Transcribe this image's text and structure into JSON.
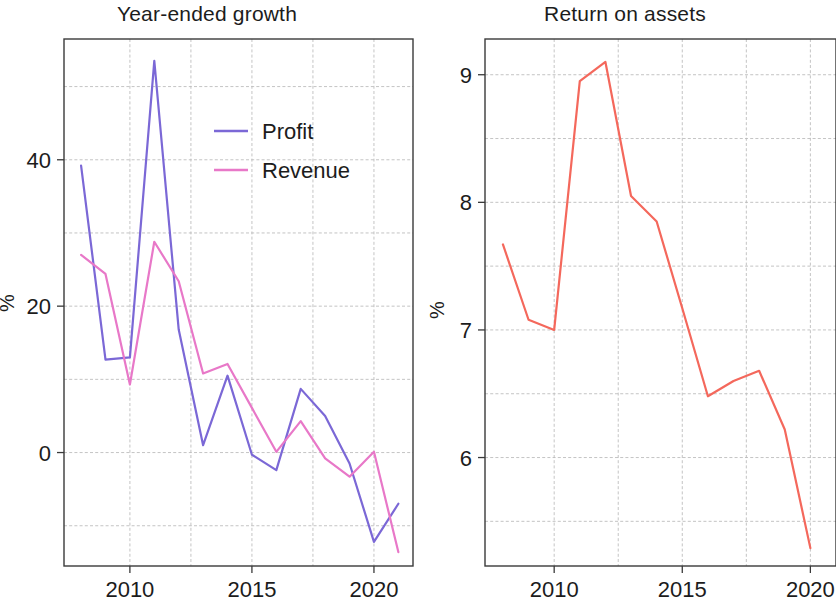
{
  "figure": {
    "width": 836,
    "height": 604,
    "background": "#ffffff"
  },
  "panels": [
    {
      "id": "year-ended-growth",
      "title": "Year-ended growth",
      "ylabel": "%",
      "x_tick_labels": [
        "2010",
        "2015",
        "2020"
      ],
      "y_tick_labels": [
        "0",
        "20",
        "40"
      ],
      "legend": [
        {
          "label": "Profit",
          "color": "#7b68d6"
        },
        {
          "label": "Revenue",
          "color": "#e878c8"
        }
      ]
    },
    {
      "id": "return-on-assets",
      "title": "Return on assets",
      "ylabel": "%",
      "x_tick_labels": [
        "2010",
        "2015",
        "2020"
      ],
      "y_tick_labels": [
        "6",
        "7",
        "8",
        "9"
      ],
      "legend": []
    }
  ],
  "chart_data": [
    {
      "type": "line",
      "title": "Year-ended growth",
      "xlabel": "",
      "ylabel": "%",
      "x": [
        2008,
        2009,
        2010,
        2011,
        2012,
        2013,
        2014,
        2015,
        2016,
        2017,
        2018,
        2019,
        2020,
        2021
      ],
      "xlim": [
        2007.3,
        2021.6
      ],
      "ylim": [
        -15.5,
        56.5
      ],
      "xticks": [
        2010,
        2015,
        2020
      ],
      "yticks": [
        0,
        20,
        40
      ],
      "gridlines_y": [
        -10,
        0,
        10,
        20,
        30,
        40,
        50
      ],
      "gridlines_x": [
        2010,
        2012.5,
        2015,
        2017.5,
        2020
      ],
      "grid": true,
      "legend_position": "upper right",
      "series": [
        {
          "name": "Profit",
          "color": "#7b68d6",
          "values": [
            39.2,
            12.7,
            13.0,
            53.5,
            16.8,
            1.0,
            10.5,
            -0.3,
            -2.4,
            8.7,
            5.0,
            -1.5,
            -12.2,
            -7.0
          ]
        },
        {
          "name": "Revenue",
          "color": "#e878c8",
          "values": [
            27.0,
            24.4,
            9.3,
            28.8,
            23.4,
            10.8,
            12.1,
            6.1,
            0.1,
            4.3,
            -0.8,
            -3.3,
            0.1,
            -13.6
          ]
        }
      ]
    },
    {
      "type": "line",
      "title": "Return on assets",
      "xlabel": "",
      "ylabel": "%",
      "x": [
        2008,
        2009,
        2010,
        2011,
        2012,
        2013,
        2014,
        2015,
        2016,
        2017,
        2018,
        2019,
        2020
      ],
      "xlim": [
        2007.3,
        2021.0
      ],
      "ylim": [
        5.15,
        9.28
      ],
      "xticks": [
        2010,
        2015,
        2020
      ],
      "yticks": [
        6,
        7,
        8,
        9
      ],
      "gridlines_y": [
        5.5,
        6.0,
        6.5,
        7.0,
        7.5,
        8.0,
        8.5,
        9.0
      ],
      "gridlines_x": [
        2010,
        2012.5,
        2015,
        2017.5,
        2020
      ],
      "grid": true,
      "legend_position": "none",
      "series": [
        {
          "name": "Return on assets",
          "color": "#f4685c",
          "values": [
            7.67,
            7.08,
            7.0,
            8.95,
            9.1,
            8.05,
            7.85,
            7.17,
            6.48,
            6.6,
            6.68,
            6.22,
            5.29
          ]
        }
      ]
    }
  ]
}
